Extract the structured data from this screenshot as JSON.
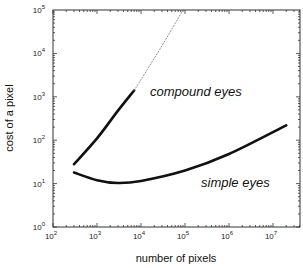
{
  "chart_data": {
    "type": "line",
    "title": "",
    "xlabel": "number of pixels",
    "ylabel": "cost of a pixel",
    "xscale": "log",
    "yscale": "log",
    "xlim": [
      100,
      40000000
    ],
    "ylim": [
      1,
      100000
    ],
    "grid": false,
    "legend": "none (inline annotations)",
    "x_ticks": [
      "10^2",
      "10^3",
      "10^4",
      "10^5",
      "10^6",
      "10^7"
    ],
    "y_ticks": [
      "10^0",
      "10^1",
      "10^2",
      "10^3",
      "10^4",
      "10^5"
    ],
    "series": [
      {
        "name": "compound eyes",
        "style": "solid",
        "x": [
          300,
          1000,
          3000,
          7000
        ],
        "y": [
          28,
          110,
          480,
          1400
        ]
      },
      {
        "name": "compound eyes (extrapolated)",
        "style": "dotted",
        "x": [
          7000,
          30000,
          90000
        ],
        "y": [
          1400,
          15000,
          100000
        ]
      },
      {
        "name": "simple eyes",
        "style": "solid",
        "x": [
          300,
          1000,
          3000,
          10000,
          100000,
          1000000,
          20000000
        ],
        "y": [
          18,
          12,
          10.3,
          11.5,
          20,
          48,
          220
        ]
      }
    ],
    "annotations": [
      {
        "text": "compound eyes",
        "near": "x≈2e4, y≈1e3"
      },
      {
        "text": "simple eyes",
        "near": "x≈1e6, y≈1.2e1"
      }
    ]
  },
  "labels": {
    "xlabel": "number of pixels",
    "ylabel": "cost of a pixel",
    "compound": "compound eyes",
    "simple": "simple eyes"
  },
  "ticks": {
    "x": [
      {
        "base": "10",
        "exp": "2"
      },
      {
        "base": "10",
        "exp": "3"
      },
      {
        "base": "10",
        "exp": "4"
      },
      {
        "base": "10",
        "exp": "5"
      },
      {
        "base": "10",
        "exp": "6"
      },
      {
        "base": "10",
        "exp": "7"
      }
    ],
    "y": [
      {
        "base": "10",
        "exp": "0"
      },
      {
        "base": "10",
        "exp": "1"
      },
      {
        "base": "10",
        "exp": "2"
      },
      {
        "base": "10",
        "exp": "3"
      },
      {
        "base": "10",
        "exp": "4"
      },
      {
        "base": "10",
        "exp": "5"
      }
    ]
  }
}
